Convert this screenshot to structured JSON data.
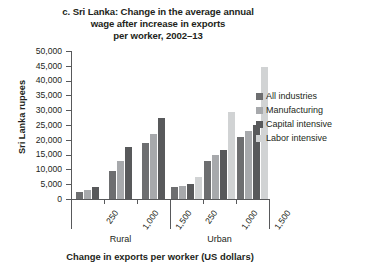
{
  "chart_data": {
    "type": "bar",
    "title": "c. Sri Lanka: Change in the average annual wage after increase in exports per worker, 2002–13",
    "title_lines": [
      "c. Sri Lanka: Change in the average annual",
      "wage after increase in exports",
      "per worker, 2002–13"
    ],
    "xlabel": "Change in exports per worker (US dollars)",
    "ylabel": "Sri Lanka rupees",
    "ylim": [
      0,
      50000
    ],
    "ytick_step": 5000,
    "ytick_labels": [
      "50,000",
      "45,000",
      "40,000",
      "35,000",
      "30,000",
      "25,000",
      "20,000",
      "15,000",
      "10,000",
      "5,000",
      "0"
    ],
    "ytick_values": [
      50000,
      45000,
      40000,
      35000,
      30000,
      25000,
      20000,
      15000,
      10000,
      5000,
      0
    ],
    "grid": false,
    "legend_position": "right",
    "groups": [
      "Rural",
      "Urban"
    ],
    "categories": [
      "250",
      "1,000",
      "1,500"
    ],
    "series": [
      {
        "name": "All industries",
        "color": "#6d6e70",
        "values": {
          "Rural": [
            2500,
            9500,
            19000
          ],
          "Urban": [
            4200,
            13000,
            21000
          ]
        }
      },
      {
        "name": "Manufacturing",
        "color": "#a7a9ac",
        "values": {
          "Rural": [
            3000,
            13000,
            22000
          ],
          "Urban": [
            4500,
            15000,
            23000
          ]
        }
      },
      {
        "name": "Capital intensive",
        "color": "#58595b",
        "values": {
          "Rural": [
            4000,
            17500,
            27500
          ],
          "Urban": [
            5000,
            16500,
            25000
          ]
        }
      },
      {
        "name": "Labor intensive",
        "color": "#d1d3d4",
        "values": {
          "Rural": [
            null,
            null,
            null
          ],
          "Urban": [
            7500,
            29500,
            44500
          ]
        }
      }
    ]
  }
}
